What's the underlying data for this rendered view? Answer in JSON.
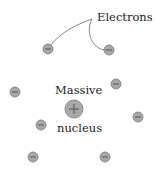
{
  "labels": {
    "electrons": "Electrons",
    "massive": "Massive",
    "nucleus": "nucleus"
  },
  "nucleus": {
    "x": 74,
    "y": 109,
    "r": 9,
    "symbol": "+",
    "color": "#a8a8a8"
  },
  "electrons": [
    {
      "x": 48,
      "y": 49
    },
    {
      "x": 109,
      "y": 50
    },
    {
      "x": 15,
      "y": 92
    },
    {
      "x": 116,
      "y": 84
    },
    {
      "x": 41,
      "y": 125
    },
    {
      "x": 138,
      "y": 117
    },
    {
      "x": 33,
      "y": 157
    },
    {
      "x": 105,
      "y": 157
    }
  ],
  "electron_style": {
    "r": 5,
    "fill": "#a8a8a8",
    "stroke": "#777777",
    "symbol": "-"
  },
  "leader_lines": [
    {
      "from": [
        92,
        19
      ],
      "to": [
        48,
        49
      ]
    },
    {
      "from": [
        92,
        19
      ],
      "to": [
        109,
        50
      ]
    }
  ]
}
